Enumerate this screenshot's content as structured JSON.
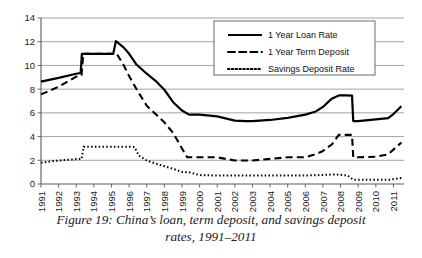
{
  "caption": {
    "line1": "Figure 19: China’s loan, term deposit, and savings deposit",
    "line2": "rates, 1991–2011"
  },
  "legend": {
    "position": "top-right",
    "entries": [
      {
        "label": "1 Year Loan Rate",
        "style": "solid"
      },
      {
        "label": "1 Year Term Deposit",
        "style": "dashed"
      },
      {
        "label": "Savings Deposit Rate",
        "style": "dotted"
      }
    ]
  },
  "axis": {
    "y_ticks": [
      "0",
      "2",
      "4",
      "6",
      "8",
      "10",
      "12",
      "14"
    ],
    "x_ticks": [
      "1991",
      "1992",
      "1993",
      "1994",
      "1995",
      "1996",
      "1997",
      "1998",
      "1999",
      "2000",
      "2001",
      "2002",
      "2003",
      "2004",
      "2005",
      "2006",
      "2007",
      "2008",
      "2009",
      "2010",
      "2011"
    ]
  },
  "colors": {
    "line": "#000000",
    "grid": "#8c8c8c",
    "axis": "#5a5a5a",
    "background": "#ffffff"
  },
  "chart_data": {
    "type": "line",
    "title": "Figure 19: China’s loan, term deposit, and savings deposit rates, 1991–2011",
    "xlabel": "",
    "ylabel": "",
    "xlim": [
      1991,
      2011.6
    ],
    "ylim": [
      0,
      14
    ],
    "ytick_interval": 2,
    "grid": "horizontal",
    "legend_position": "top-right",
    "categories": [
      "1991",
      "1992",
      "1993",
      "1994",
      "1995",
      "1996",
      "1997",
      "1998",
      "1999",
      "2000",
      "2001",
      "2002",
      "2003",
      "2004",
      "2005",
      "2006",
      "2007",
      "2008",
      "2009",
      "2010",
      "2011"
    ],
    "series": [
      {
        "name": "1 Year Loan Rate",
        "style": "solid",
        "points": [
          [
            1991.0,
            8.64
          ],
          [
            1992.0,
            8.95
          ],
          [
            1993.0,
            9.3
          ],
          [
            1993.25,
            9.36
          ],
          [
            1993.32,
            10.98
          ],
          [
            1994.0,
            10.98
          ],
          [
            1995.0,
            10.98
          ],
          [
            1995.1,
            10.98
          ],
          [
            1995.25,
            12.06
          ],
          [
            1995.7,
            11.5
          ],
          [
            1996.0,
            10.98
          ],
          [
            1996.4,
            10.1
          ],
          [
            1997.0,
            9.3
          ],
          [
            1997.5,
            8.7
          ],
          [
            1998.0,
            7.95
          ],
          [
            1998.5,
            6.9
          ],
          [
            1999.0,
            6.2
          ],
          [
            1999.4,
            5.85
          ],
          [
            2000.0,
            5.85
          ],
          [
            2001.0,
            5.7
          ],
          [
            2002.0,
            5.35
          ],
          [
            2002.6,
            5.31
          ],
          [
            2003.0,
            5.31
          ],
          [
            2004.0,
            5.4
          ],
          [
            2005.0,
            5.58
          ],
          [
            2006.0,
            5.85
          ],
          [
            2006.6,
            6.12
          ],
          [
            2007.0,
            6.5
          ],
          [
            2007.5,
            7.2
          ],
          [
            2007.9,
            7.47
          ],
          [
            2008.3,
            7.47
          ],
          [
            2008.65,
            7.45
          ],
          [
            2008.72,
            5.31
          ],
          [
            2009.0,
            5.31
          ],
          [
            2010.0,
            5.45
          ],
          [
            2010.7,
            5.56
          ],
          [
            2011.0,
            5.9
          ],
          [
            2011.45,
            6.56
          ]
        ]
      },
      {
        "name": "1 Year Term Deposit",
        "style": "dashed",
        "points": [
          [
            1991.0,
            7.56
          ],
          [
            1992.0,
            8.2
          ],
          [
            1993.0,
            9.05
          ],
          [
            1993.3,
            9.18
          ],
          [
            1993.4,
            10.98
          ],
          [
            1994.0,
            10.98
          ],
          [
            1995.0,
            10.98
          ],
          [
            1995.3,
            10.98
          ],
          [
            1995.7,
            10.0
          ],
          [
            1996.0,
            9.1
          ],
          [
            1996.5,
            7.8
          ],
          [
            1997.0,
            6.6
          ],
          [
            1997.5,
            5.9
          ],
          [
            1998.0,
            5.2
          ],
          [
            1998.5,
            4.3
          ],
          [
            1999.0,
            3.0
          ],
          [
            1999.3,
            2.25
          ],
          [
            2000.0,
            2.25
          ],
          [
            2001.0,
            2.25
          ],
          [
            2002.0,
            1.98
          ],
          [
            2002.6,
            1.98
          ],
          [
            2003.0,
            1.98
          ],
          [
            2004.0,
            2.12
          ],
          [
            2005.0,
            2.25
          ],
          [
            2006.0,
            2.25
          ],
          [
            2006.6,
            2.52
          ],
          [
            2007.0,
            2.79
          ],
          [
            2007.5,
            3.33
          ],
          [
            2007.9,
            4.14
          ],
          [
            2008.3,
            4.14
          ],
          [
            2008.65,
            4.14
          ],
          [
            2008.72,
            2.25
          ],
          [
            2009.0,
            2.25
          ],
          [
            2010.0,
            2.3
          ],
          [
            2010.7,
            2.5
          ],
          [
            2011.0,
            2.9
          ],
          [
            2011.45,
            3.5
          ]
        ]
      },
      {
        "name": "Savings Deposit Rate",
        "style": "dotted",
        "points": [
          [
            1991.0,
            1.8
          ],
          [
            1992.0,
            1.98
          ],
          [
            1993.0,
            2.1
          ],
          [
            1993.3,
            2.1
          ],
          [
            1993.42,
            3.15
          ],
          [
            1994.0,
            3.15
          ],
          [
            1995.0,
            3.15
          ],
          [
            1996.0,
            3.15
          ],
          [
            1996.3,
            3.12
          ],
          [
            1996.55,
            2.4
          ],
          [
            1997.0,
            1.98
          ],
          [
            1997.5,
            1.72
          ],
          [
            1998.0,
            1.5
          ],
          [
            1998.5,
            1.28
          ],
          [
            1999.0,
            1.02
          ],
          [
            1999.4,
            0.99
          ],
          [
            2000.0,
            0.75
          ],
          [
            2001.0,
            0.72
          ],
          [
            2002.0,
            0.72
          ],
          [
            2003.0,
            0.72
          ],
          [
            2004.0,
            0.72
          ],
          [
            2005.0,
            0.72
          ],
          [
            2006.0,
            0.72
          ],
          [
            2007.0,
            0.76
          ],
          [
            2007.6,
            0.81
          ],
          [
            2008.0,
            0.78
          ],
          [
            2008.4,
            0.72
          ],
          [
            2008.72,
            0.36
          ],
          [
            2009.0,
            0.36
          ],
          [
            2010.0,
            0.36
          ],
          [
            2010.8,
            0.36
          ],
          [
            2011.0,
            0.41
          ],
          [
            2011.45,
            0.5
          ]
        ]
      }
    ]
  }
}
